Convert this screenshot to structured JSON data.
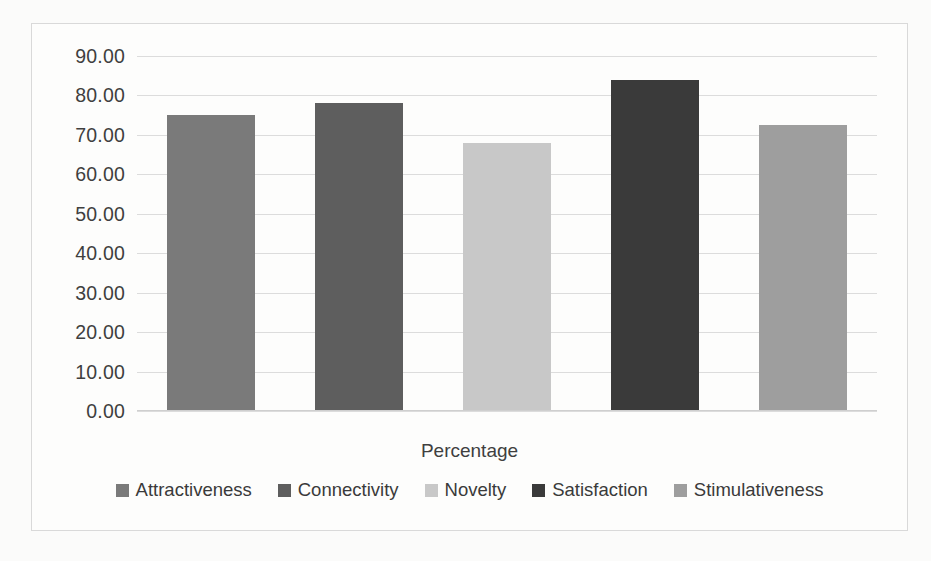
{
  "chart_data": {
    "type": "bar",
    "title": "",
    "xlabel": "Percentage",
    "ylabel": "",
    "categories": [
      "Attractiveness",
      "Connectivity",
      "Novelty",
      "Satisfaction",
      "Stimulativeness"
    ],
    "values": [
      75.0,
      78.0,
      68.0,
      84.0,
      72.5
    ],
    "ylim": [
      0,
      90
    ],
    "ytick_labels": [
      "90.00",
      "80.00",
      "70.00",
      "60.00",
      "50.00",
      "40.00",
      "30.00",
      "20.00",
      "10.00",
      "0.00"
    ],
    "ytick_values": [
      90,
      80,
      70,
      60,
      50,
      40,
      30,
      20,
      10,
      0
    ],
    "grid": true,
    "legend_position": "bottom",
    "series_colors": [
      "#7a7a7a",
      "#5e5e5e",
      "#c8c8c8",
      "#3a3a3a",
      "#9e9e9e"
    ],
    "legend": [
      {
        "label": "Attractiveness",
        "color": "#7a7a7a"
      },
      {
        "label": "Connectivity",
        "color": "#5e5e5e"
      },
      {
        "label": "Novelty",
        "color": "#c8c8c8"
      },
      {
        "label": "Satisfaction",
        "color": "#3a3a3a"
      },
      {
        "label": "Stimulativeness",
        "color": "#9e9e9e"
      }
    ]
  },
  "frame": {
    "border_color": "#d9d9d9",
    "background": "#fdfdfc"
  }
}
